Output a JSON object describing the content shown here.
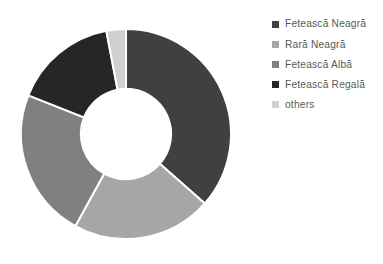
{
  "chart_data": {
    "type": "pie",
    "variant": "doughnut",
    "title": "",
    "subtitle": "",
    "xlabel": "",
    "ylabel": "",
    "grid": false,
    "legend_position": "right",
    "start_angle_deg": 0,
    "direction": "clockwise",
    "inner_radius_ratio": 0.43,
    "categories": [
      "Fetească Neagră",
      "Rară Neagră",
      "Fetească Albă",
      "Fetească Regală",
      "others"
    ],
    "values": [
      36.5,
      21.5,
      23.0,
      16.0,
      3.0
    ],
    "colors": [
      "#404040",
      "#a6a6a6",
      "#808080",
      "#262626",
      "#d0d0d0"
    ],
    "slices": [
      {
        "label": "Fetească Neagră",
        "value": 36.5,
        "color": "#404040",
        "start_angle_deg": 0,
        "end_angle_deg": 131.4
      },
      {
        "label": "Rară Neagră",
        "value": 21.5,
        "color": "#a6a6a6",
        "start_angle_deg": 131.4,
        "end_angle_deg": 208.8
      },
      {
        "label": "Fetească Albă",
        "value": 23.0,
        "color": "#808080",
        "start_angle_deg": 208.8,
        "end_angle_deg": 291.6
      },
      {
        "label": "Fetească Regală",
        "value": 16.0,
        "color": "#262626",
        "start_angle_deg": 291.6,
        "end_angle_deg": 349.2
      },
      {
        "label": "others",
        "value": 3.0,
        "color": "#d0d0d0",
        "start_angle_deg": 349.2,
        "end_angle_deg": 360
      }
    ]
  },
  "legend": {
    "items": [
      {
        "label": "Fetească Neagră",
        "color": "#404040",
        "swatch_icon": "square-marker-icon"
      },
      {
        "label": "Rară Neagră",
        "color": "#a6a6a6",
        "swatch_icon": "square-marker-icon"
      },
      {
        "label": "Fetească Albă",
        "color": "#808080",
        "swatch_icon": "square-marker-icon"
      },
      {
        "label": "Fetească Regală",
        "color": "#262626",
        "swatch_icon": "square-marker-icon"
      },
      {
        "label": "others",
        "color": "#d0d0d0",
        "swatch_icon": "square-marker-icon"
      }
    ]
  },
  "style": {
    "background": "#ffffff",
    "legend_text_color": "#595959",
    "slice_separator_color": "#ffffff"
  }
}
